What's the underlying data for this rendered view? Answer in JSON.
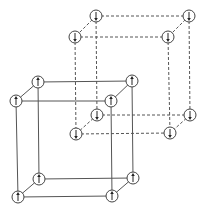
{
  "diagram": {
    "type": "interpenetrating-cubic-lattices",
    "colors": {
      "line": "#555555",
      "node": "#444444",
      "arrow": "#222222",
      "background": "#ffffff"
    },
    "node_radius": 6,
    "lattices": [
      {
        "name": "dashed-lattice",
        "style": "dashed",
        "spin": "down",
        "nodes": [
          {
            "id": "d_btl",
            "x": 96,
            "y": 16
          },
          {
            "id": "d_btr",
            "x": 189,
            "y": 16
          },
          {
            "id": "d_ftl",
            "x": 75,
            "y": 37
          },
          {
            "id": "d_ftr",
            "x": 168,
            "y": 37
          },
          {
            "id": "d_bbl",
            "x": 97,
            "y": 115
          },
          {
            "id": "d_bbr",
            "x": 190,
            "y": 115
          },
          {
            "id": "d_fbl",
            "x": 76,
            "y": 134
          },
          {
            "id": "d_fbr",
            "x": 170,
            "y": 133
          }
        ],
        "edges": [
          [
            "d_btl",
            "d_btr"
          ],
          [
            "d_ftl",
            "d_ftr"
          ],
          [
            "d_btl",
            "d_ftl"
          ],
          [
            "d_btr",
            "d_ftr"
          ],
          [
            "d_bbl",
            "d_bbr"
          ],
          [
            "d_fbl",
            "d_fbr"
          ],
          [
            "d_bbl",
            "d_fbl"
          ],
          [
            "d_bbr",
            "d_fbr"
          ],
          [
            "d_btl",
            "d_bbl"
          ],
          [
            "d_btr",
            "d_bbr"
          ],
          [
            "d_ftl",
            "d_fbl"
          ],
          [
            "d_ftr",
            "d_fbr"
          ]
        ]
      },
      {
        "name": "solid-lattice",
        "style": "solid",
        "spin": "up",
        "nodes": [
          {
            "id": "s_btl",
            "x": 38,
            "y": 82
          },
          {
            "id": "s_btr",
            "x": 132,
            "y": 81
          },
          {
            "id": "s_ftl",
            "x": 16,
            "y": 101
          },
          {
            "id": "s_ftr",
            "x": 111,
            "y": 101
          },
          {
            "id": "s_bbl",
            "x": 39,
            "y": 179
          },
          {
            "id": "s_bbr",
            "x": 133,
            "y": 178
          },
          {
            "id": "s_fbl",
            "x": 18,
            "y": 197
          },
          {
            "id": "s_fbr",
            "x": 112,
            "y": 196
          }
        ],
        "edges": [
          [
            "s_btl",
            "s_btr"
          ],
          [
            "s_ftl",
            "s_ftr"
          ],
          [
            "s_btl",
            "s_ftl"
          ],
          [
            "s_btr",
            "s_ftr"
          ],
          [
            "s_bbl",
            "s_bbr"
          ],
          [
            "s_fbl",
            "s_fbr"
          ],
          [
            "s_bbl",
            "s_fbl"
          ],
          [
            "s_bbr",
            "s_fbr"
          ],
          [
            "s_btl",
            "s_bbl"
          ],
          [
            "s_btr",
            "s_bbr"
          ],
          [
            "s_ftl",
            "s_fbl"
          ],
          [
            "s_ftr",
            "s_fbr"
          ]
        ]
      }
    ]
  }
}
